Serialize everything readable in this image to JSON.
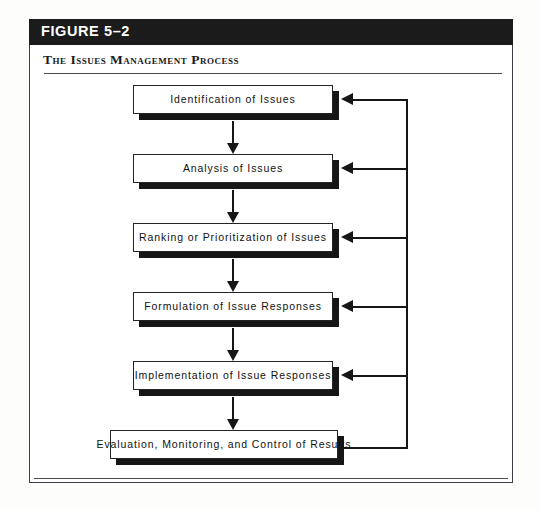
{
  "figure": {
    "number_label": "FIGURE 5–2",
    "subtitle": "The Issues Management Process"
  },
  "colors": {
    "title_bar_bg": "#1b1b1b",
    "title_bar_text": "#ffffff",
    "frame_border": "#3a3f45",
    "box_border": "#242424",
    "box_fill": "#ffffff",
    "box_shadow": "#161616",
    "arrow": "#161616",
    "rule": "#4a4a4a",
    "page_bg": "#ffffff"
  },
  "chart_data": {
    "type": "diagram",
    "diagram_kind": "process-flowchart",
    "title": "The Issues Management Process",
    "figure_number": "FIGURE 5–2",
    "orientation": "top-to-bottom",
    "node_count": 6,
    "nodes": [
      {
        "id": "n1",
        "label": "Identification of Issues",
        "order": 1
      },
      {
        "id": "n2",
        "label": "Analysis of Issues",
        "order": 2
      },
      {
        "id": "n3",
        "label": "Ranking or Prioritization of Issues",
        "order": 3
      },
      {
        "id": "n4",
        "label": "Formulation of Issue Responses",
        "order": 4
      },
      {
        "id": "n5",
        "label": "Implementation of Issue Responses",
        "order": 5
      },
      {
        "id": "n6",
        "label": "Evaluation, Monitoring, and Control of Results",
        "order": 6
      }
    ],
    "forward_edges": [
      {
        "from": "n1",
        "to": "n2",
        "style": "arrow-down"
      },
      {
        "from": "n2",
        "to": "n3",
        "style": "arrow-down"
      },
      {
        "from": "n3",
        "to": "n4",
        "style": "arrow-down"
      },
      {
        "from": "n4",
        "to": "n5",
        "style": "arrow-down"
      },
      {
        "from": "n5",
        "to": "n6",
        "style": "arrow-down"
      }
    ],
    "feedback_edges": [
      {
        "from": "n6",
        "to": "n1",
        "style": "arrow-left",
        "label": ""
      },
      {
        "from": "n6",
        "to": "n2",
        "style": "arrow-left",
        "label": ""
      },
      {
        "from": "n6",
        "to": "n3",
        "style": "arrow-left",
        "label": ""
      },
      {
        "from": "n6",
        "to": "n4",
        "style": "arrow-left",
        "label": ""
      },
      {
        "from": "n6",
        "to": "n5",
        "style": "arrow-left",
        "label": ""
      }
    ]
  },
  "boxes": [
    {
      "label": "Identification of Issues",
      "left": 133,
      "top": 85,
      "width": 200
    },
    {
      "label": "Analysis of Issues",
      "left": 133,
      "top": 154,
      "width": 200
    },
    {
      "label": "Ranking or Prioritization of Issues",
      "left": 133,
      "top": 223,
      "width": 200
    },
    {
      "label": "Formulation of Issue Responses",
      "left": 133,
      "top": 292,
      "width": 200
    },
    {
      "label": "Implementation of Issue Responses",
      "left": 133,
      "top": 361,
      "width": 200
    },
    {
      "label": "Evaluation, Monitoring, and Control of Results",
      "left": 110,
      "top": 430,
      "width": 228
    }
  ]
}
